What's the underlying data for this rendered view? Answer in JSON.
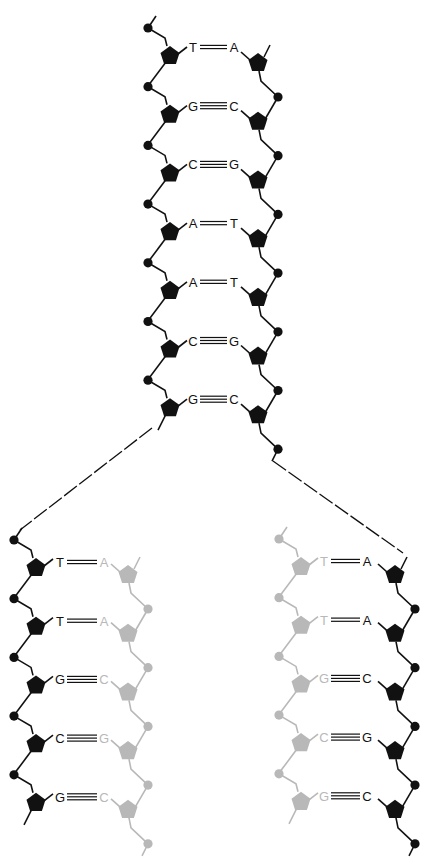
{
  "colors": {
    "parent": "#111111",
    "new_strand": "#b8b8b8",
    "background": "#ffffff"
  },
  "parent_helix": {
    "pairs": [
      {
        "left": "T",
        "right": "A",
        "bonds": 2
      },
      {
        "left": "G",
        "right": "C",
        "bonds": 3
      },
      {
        "left": "C",
        "right": "G",
        "bonds": 3
      },
      {
        "left": "A",
        "right": "T",
        "bonds": 2
      },
      {
        "left": "A",
        "right": "T",
        "bonds": 2
      },
      {
        "left": "C",
        "right": "G",
        "bonds": 3
      },
      {
        "left": "G",
        "right": "C",
        "bonds": 3
      }
    ]
  },
  "daughter_left": {
    "old_strand": "left",
    "pairs": [
      {
        "left": "T",
        "right": "A",
        "bonds": 2
      },
      {
        "left": "T",
        "right": "A",
        "bonds": 2
      },
      {
        "left": "G",
        "right": "C",
        "bonds": 3
      },
      {
        "left": "C",
        "right": "G",
        "bonds": 3
      },
      {
        "left": "G",
        "right": "C",
        "bonds": 3
      }
    ]
  },
  "daughter_right": {
    "old_strand": "right",
    "pairs": [
      {
        "left": "T",
        "right": "A",
        "bonds": 2
      },
      {
        "left": "T",
        "right": "A",
        "bonds": 2
      },
      {
        "left": "G",
        "right": "C",
        "bonds": 3
      },
      {
        "left": "C",
        "right": "G",
        "bonds": 3
      },
      {
        "left": "G",
        "right": "C",
        "bonds": 3
      }
    ]
  }
}
